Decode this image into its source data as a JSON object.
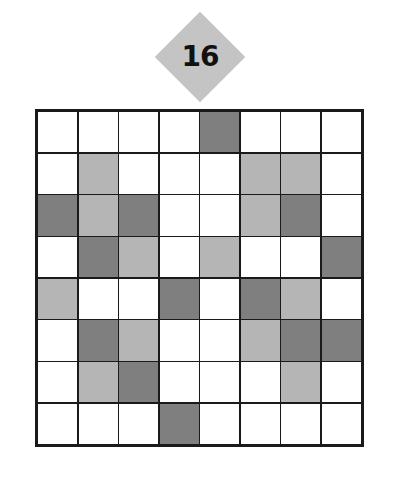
{
  "puzzle": {
    "number": "16",
    "colors": {
      "white": "#ffffff",
      "light": "#b5b5b5",
      "dark": "#7f7f7f",
      "badge": "#c4c4c4",
      "grid_line": "#1a1a1a"
    },
    "grid": [
      [
        "W",
        "W",
        "W",
        "W",
        "D",
        "W",
        "W",
        "W"
      ],
      [
        "W",
        "L",
        "W",
        "W",
        "W",
        "L",
        "L",
        "W"
      ],
      [
        "D",
        "L",
        "D",
        "W",
        "W",
        "L",
        "D",
        "W"
      ],
      [
        "W",
        "D",
        "L",
        "W",
        "L",
        "W",
        "W",
        "D"
      ],
      [
        "L",
        "W",
        "W",
        "D",
        "W",
        "D",
        "L",
        "W"
      ],
      [
        "W",
        "D",
        "L",
        "W",
        "W",
        "L",
        "D",
        "D"
      ],
      [
        "W",
        "L",
        "D",
        "W",
        "W",
        "W",
        "L",
        "W"
      ],
      [
        "W",
        "W",
        "W",
        "D",
        "W",
        "W",
        "W",
        "W"
      ]
    ]
  }
}
